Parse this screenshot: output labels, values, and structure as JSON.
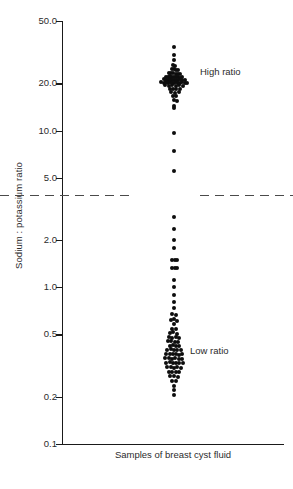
{
  "chart_data": {
    "type": "scatter",
    "title": "",
    "subtitle": "",
    "xlabel": "Samples of breast cyst fluid",
    "ylabel": "Sodium : potassium ratio",
    "yscale": "log",
    "ylim": [
      0.1,
      50.0
    ],
    "grid": false,
    "legend_position": "none",
    "ytick_labels": [
      "50.0",
      "20.0",
      "10.0",
      "5.0",
      "2.0",
      "1.0",
      "0.5",
      "0.2",
      "0.1"
    ],
    "ytick_values": [
      50.0,
      20.0,
      10.0,
      5.0,
      2.0,
      1.0,
      0.5,
      0.2,
      0.1
    ],
    "xtick_labels": [],
    "annotations": [
      {
        "text": "High ratio",
        "value_y": 21.0
      },
      {
        "text": "Low ratio",
        "value_y": 0.47
      }
    ],
    "reference_line": {
      "value": 3.9,
      "style": "dashed",
      "color": "#4a4a4a",
      "gapped_at_data_column": true
    },
    "series": [
      {
        "name": "High ratio",
        "color": "#0d0d0d",
        "points": [
          [
            0.0,
            34.0
          ],
          [
            0.0,
            30.5
          ],
          [
            0.0,
            28.0
          ],
          [
            -0.3,
            26.2
          ],
          [
            0.4,
            26.0
          ],
          [
            -0.8,
            24.6
          ],
          [
            -0.1,
            24.8
          ],
          [
            0.6,
            24.4
          ],
          [
            1.2,
            24.2
          ],
          [
            -1.6,
            23.2
          ],
          [
            -0.9,
            23.3
          ],
          [
            -0.2,
            23.4
          ],
          [
            0.5,
            23.1
          ],
          [
            1.3,
            23.0
          ],
          [
            2.0,
            22.9
          ],
          [
            -2.8,
            22.0
          ],
          [
            -2.1,
            22.1
          ],
          [
            -1.4,
            22.2
          ],
          [
            -0.7,
            22.0
          ],
          [
            0.0,
            22.1
          ],
          [
            0.7,
            21.9
          ],
          [
            1.4,
            22.0
          ],
          [
            2.1,
            21.8
          ],
          [
            2.8,
            21.9
          ],
          [
            -3.5,
            21.2
          ],
          [
            -2.8,
            21.1
          ],
          [
            -2.1,
            21.0
          ],
          [
            -1.4,
            21.2
          ],
          [
            -0.7,
            21.1
          ],
          [
            0.0,
            21.0
          ],
          [
            0.7,
            21.1
          ],
          [
            1.4,
            21.0
          ],
          [
            2.1,
            21.2
          ],
          [
            2.8,
            21.1
          ],
          [
            3.5,
            21.0
          ],
          [
            -4.2,
            20.3
          ],
          [
            -3.5,
            20.2
          ],
          [
            -2.8,
            20.4
          ],
          [
            -2.1,
            20.2
          ],
          [
            -1.4,
            20.3
          ],
          [
            -0.7,
            20.1
          ],
          [
            0.0,
            20.2
          ],
          [
            0.7,
            20.3
          ],
          [
            1.4,
            20.1
          ],
          [
            2.1,
            20.2
          ],
          [
            2.8,
            20.3
          ],
          [
            3.5,
            20.1
          ],
          [
            4.2,
            20.2
          ],
          [
            -3.0,
            19.4
          ],
          [
            -1.8,
            19.3
          ],
          [
            -0.6,
            19.5
          ],
          [
            0.6,
            19.3
          ],
          [
            1.8,
            19.4
          ],
          [
            3.0,
            19.2
          ],
          [
            -1.5,
            18.4
          ],
          [
            -0.4,
            18.5
          ],
          [
            0.8,
            18.3
          ],
          [
            2.0,
            18.4
          ],
          [
            -0.9,
            17.5
          ],
          [
            0.3,
            17.4
          ],
          [
            1.5,
            17.6
          ],
          [
            -0.5,
            16.6
          ],
          [
            0.7,
            16.5
          ],
          [
            0.0,
            15.6
          ],
          [
            0.9,
            15.5
          ],
          [
            0.0,
            14.4
          ],
          [
            0.0,
            14.0
          ]
        ]
      },
      {
        "name": "Intermediate",
        "color": "#0d0d0d",
        "points": [
          [
            0.0,
            9.7
          ],
          [
            0.0,
            7.4
          ],
          [
            0.0,
            5.5
          ]
        ]
      },
      {
        "name": "Low ratio",
        "color": "#0d0d0d",
        "points": [
          [
            0.0,
            2.8
          ],
          [
            0.0,
            2.35
          ],
          [
            0.0,
            2.0
          ],
          [
            0.0,
            1.78
          ],
          [
            -0.8,
            1.5
          ],
          [
            0.4,
            1.5
          ],
          [
            1.1,
            1.5
          ],
          [
            -0.8,
            1.32
          ],
          [
            0.3,
            1.32
          ],
          [
            1.0,
            1.32
          ],
          [
            0.0,
            1.12
          ],
          [
            0.0,
            1.0
          ],
          [
            0.0,
            0.89
          ],
          [
            0.0,
            0.8
          ],
          [
            0.0,
            0.74
          ],
          [
            -0.6,
            0.68
          ],
          [
            0.7,
            0.67
          ],
          [
            -1.1,
            0.62
          ],
          [
            0.0,
            0.63
          ],
          [
            1.0,
            0.61
          ],
          [
            0.0,
            0.58
          ],
          [
            -0.7,
            0.545
          ],
          [
            0.6,
            0.54
          ],
          [
            -1.3,
            0.51
          ],
          [
            -0.2,
            0.515
          ],
          [
            0.9,
            0.505
          ],
          [
            -1.7,
            0.48
          ],
          [
            -0.6,
            0.478
          ],
          [
            0.5,
            0.482
          ],
          [
            1.5,
            0.475
          ],
          [
            -2.0,
            0.452
          ],
          [
            -0.9,
            0.455
          ],
          [
            0.2,
            0.45
          ],
          [
            1.2,
            0.448
          ],
          [
            -1.5,
            0.425
          ],
          [
            -0.4,
            0.428
          ],
          [
            0.7,
            0.422
          ],
          [
            1.8,
            0.42
          ],
          [
            -2.2,
            0.4
          ],
          [
            -1.1,
            0.402
          ],
          [
            0.0,
            0.398
          ],
          [
            1.1,
            0.4
          ],
          [
            2.2,
            0.396
          ],
          [
            -2.6,
            0.375
          ],
          [
            -1.5,
            0.377
          ],
          [
            -0.4,
            0.373
          ],
          [
            0.7,
            0.376
          ],
          [
            1.8,
            0.372
          ],
          [
            2.8,
            0.374
          ],
          [
            -2.9,
            0.352
          ],
          [
            -1.8,
            0.354
          ],
          [
            -0.7,
            0.35
          ],
          [
            0.4,
            0.353
          ],
          [
            1.5,
            0.349
          ],
          [
            2.6,
            0.351
          ],
          [
            -2.6,
            0.33
          ],
          [
            -1.5,
            0.332
          ],
          [
            -0.4,
            0.328
          ],
          [
            0.7,
            0.331
          ],
          [
            1.8,
            0.327
          ],
          [
            2.9,
            0.329
          ],
          [
            -2.2,
            0.308
          ],
          [
            -1.1,
            0.31
          ],
          [
            0.0,
            0.306
          ],
          [
            1.1,
            0.309
          ],
          [
            2.2,
            0.305
          ],
          [
            -1.7,
            0.288
          ],
          [
            -0.6,
            0.29
          ],
          [
            0.5,
            0.287
          ],
          [
            1.6,
            0.289
          ],
          [
            -1.2,
            0.27
          ],
          [
            0.0,
            0.272
          ],
          [
            1.2,
            0.268
          ],
          [
            -0.7,
            0.252
          ],
          [
            0.6,
            0.254
          ],
          [
            0.0,
            0.236
          ],
          [
            0.0,
            0.222
          ],
          [
            0.0,
            0.205
          ]
        ]
      }
    ]
  }
}
